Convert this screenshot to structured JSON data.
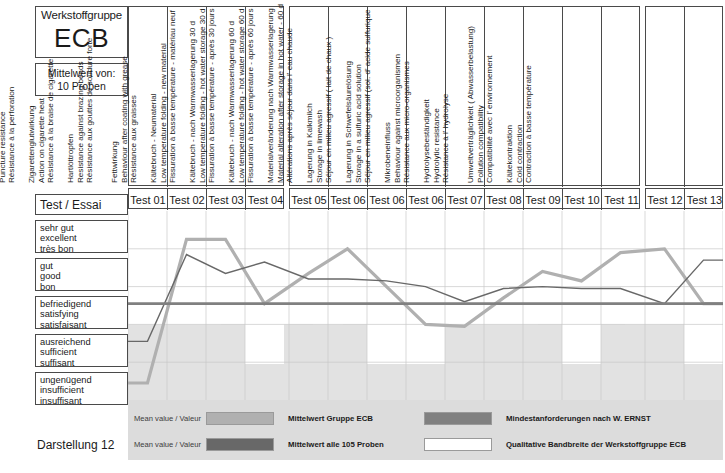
{
  "header": {
    "group_title": "Werkstoffgruppe",
    "group_code": "ECB",
    "mean_of_label": "Mittelwert von:",
    "sample_count_label": "10 Proben",
    "test_essai_label": "Test / Essai",
    "figure_caption": "Darstellung 12"
  },
  "rating_scale": [
    {
      "de": "sehr gut",
      "en": "excellent",
      "fr": "très bon"
    },
    {
      "de": "gut",
      "en": "good",
      "fr": "bon"
    },
    {
      "de": "befriedigend",
      "en": "satisfying",
      "fr": "satisfaisant"
    },
    {
      "de": "ausreichend",
      "en": "sufficient",
      "fr": "suffisant"
    },
    {
      "de": "ungenügend",
      "en": "insufficient",
      "fr": "insuffisant"
    }
  ],
  "columns": [
    {
      "number": "Test 01",
      "de": "Kälteflexibilität (Abroll-Länge)",
      "en": "Low temperature flexibility",
      "fr": "Elasticité à basse température"
    },
    {
      "number": "Test 02",
      "de": "Nagelperforation",
      "en": "Puncture resistance",
      "fr": "Résistance à la perforation"
    },
    {
      "number": "Test 03",
      "de": "Zigarettenglutwirkung",
      "en": "Action on cigarette heat",
      "fr": "Résistance à la braise de cigarette"
    },
    {
      "number": "Test 04",
      "de": "Hartlöttropfen",
      "en": "Resistance against brazing beads",
      "fr": "Résistance aux gouttes de soudure forte"
    },
    {
      "number": "Test 05",
      "de": "Fettwirkung",
      "en": "Behaviour after coating with grease",
      "fr": "Résistance aux graisses"
    },
    {
      "number": "Test 06",
      "de": "Kältebruch - Neumaterial",
      "en": "Low temperature folding - new material",
      "fr": "Fissuration à basse température - matériau neuf"
    },
    {
      "number": "Test 06",
      "de": "Kältebruch - nach Warmwasserlagerung 30 d",
      "en": "Low temperature folding - hot water storage 30 d",
      "fr": "Fissuration à basse température - après 30 jours"
    },
    {
      "number": "Test 06",
      "de": "Kältebruch - nach Warmwasserlagerung 60 d",
      "en": "Low temperature folding - hot water storage 60 d",
      "fr": "Fissuration à basse température - après 60 jours"
    },
    {
      "number": "Test 07",
      "de": "Materialveränderung nach Warmwasserlagerung",
      "en": "Material alteration after storage in hot water - 60 d",
      "fr": "Altérations après séjour dans l' eau chaude"
    },
    {
      "number": "Test 08",
      "de": "Lagerung in Kalkmilch",
      "en": "Storage in limewash",
      "fr": "Séjour en milieu agressif ( lait de chaux )"
    },
    {
      "number": "Test 09",
      "de": "Lagerung in Schwefelsäurelösung",
      "en": "Storage in a sulfuric acid solution",
      "fr": "Séjour en milieu agressif (sol. d' acide sulfurique"
    },
    {
      "number": "Test 10",
      "de": "Mikrobeneinfluss",
      "en": "Behaviour against microorganismen",
      "fr": "Résistance aux micro-organismes"
    },
    {
      "number": "Test 11",
      "de": "Hydrolysebeständigkeit",
      "en": "Hydrolytic resistance",
      "fr": "Résistance à l' hydrolyse"
    },
    {
      "number": "Test 12",
      "de": "Umweltverträglichkeit ( Abwasserbelastung)",
      "en": "Pollution compatibility",
      "fr": "Compatibilité avec l' environnement"
    },
    {
      "number": "Test 13",
      "de": "Kältekontraktion",
      "en": "Cold contraction",
      "fr": "Contraction à basse température"
    }
  ],
  "legend": {
    "mean_value_label": "Mean value / Valeur",
    "items": [
      {
        "label": "Mittelwert Gruppe ECB",
        "color": "#b0b0b0"
      },
      {
        "label": "Mindestanforderungen nach W. ERNST",
        "color": "#808080"
      },
      {
        "label": "Mittelwert alle 105 Proben",
        "color": "#686868"
      },
      {
        "label": "Qualitative Bandbreite der Werkstoffgruppe ECB",
        "color": "#ffffff"
      }
    ]
  },
  "chart_data": {
    "type": "line",
    "xlabel": "Test / Essai",
    "ylabel": "Qualitative Bewertung",
    "ylim": [
      0,
      5
    ],
    "grid": true,
    "legend_position": "bottom",
    "y_tick_labels": [
      "ungenügend / insufficient / insuffisant",
      "ausreichend / sufficient / suffisant",
      "befriedigend / satisfying / satisfaisant",
      "gut / good / bon",
      "sehr gut / excellent / très bon"
    ],
    "y_tick_values": [
      0.5,
      1.5,
      2.5,
      3.5,
      4.5
    ],
    "categories": [
      "Test 01",
      "Test 02",
      "Test 03",
      "Test 04",
      "Test 05",
      "Test 06",
      "Test 06",
      "Test 06",
      "Test 07",
      "Test 08",
      "Test 09",
      "Test 10",
      "Test 11",
      "Test 12",
      "Test 13"
    ],
    "series": [
      {
        "name": "Mittelwert Gruppe ECB",
        "color": "#b0b0b0",
        "width": 3.2,
        "values": [
          0.45,
          4.25,
          4.25,
          2.55,
          3.35,
          4.0,
          3.0,
          2.0,
          1.95,
          2.7,
          3.4,
          3.15,
          3.9,
          4.0,
          2.55
        ]
      },
      {
        "name": "Mittelwert alle 105 Proben",
        "color": "#686868",
        "width": 1.4,
        "values": [
          1.55,
          3.85,
          3.35,
          3.65,
          3.2,
          3.2,
          3.15,
          3.0,
          2.6,
          2.95,
          3.0,
          2.95,
          2.95,
          2.55,
          3.7
        ]
      },
      {
        "name": "Mindestanforderungen nach W. ERNST",
        "color": "#808080",
        "width": 2.6,
        "values": [
          2.55,
          2.55,
          2.55,
          2.55,
          2.55,
          2.55,
          2.55,
          2.55,
          2.55,
          2.55,
          2.55,
          2.55,
          2.55,
          2.55,
          2.55
        ]
      }
    ],
    "band": {
      "name": "Qualitative Bandbreite der Werkstoffgruppe ECB",
      "fill": "#e2e2e2",
      "upper": 5,
      "lower": [
        2.0,
        2.0,
        2.0,
        0.95,
        2.0,
        2.0,
        0.95,
        0.95,
        2.0,
        2.0,
        2.0,
        0.95,
        2.0,
        2.0,
        0.95
      ]
    }
  }
}
